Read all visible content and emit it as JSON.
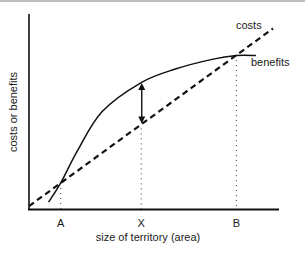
{
  "diagram": {
    "type": "line",
    "title": "",
    "xlabel": "size of territory (area)",
    "ylabel": "costs or benefits",
    "x_ticks": [
      {
        "label": "A",
        "x": 0.13,
        "meaning": "intersection where benefits first exceed costs"
      },
      {
        "label": "X",
        "x": 0.46,
        "meaning": "maximum net benefit"
      },
      {
        "label": "B",
        "x": 0.85,
        "meaning": "intersection where costs exceed benefits"
      }
    ],
    "series": [
      {
        "name": "costs",
        "style": "dashed",
        "points": [
          [
            0.0,
            0.01
          ],
          [
            1.0,
            0.93
          ]
        ]
      },
      {
        "name": "benefits",
        "style": "solid",
        "points": [
          [
            0.08,
            0.03
          ],
          [
            0.13,
            0.13
          ],
          [
            0.2,
            0.3
          ],
          [
            0.3,
            0.5
          ],
          [
            0.46,
            0.65
          ],
          [
            0.6,
            0.72
          ],
          [
            0.75,
            0.77
          ],
          [
            0.85,
            0.79
          ],
          [
            0.93,
            0.79
          ]
        ]
      }
    ],
    "annotation": {
      "type": "double-arrow",
      "x": 0.46,
      "from": "costs",
      "to": "benefits",
      "meaning": "net benefit"
    },
    "colors": {
      "ink": "#1a1a1a",
      "axis": "#111111"
    }
  }
}
